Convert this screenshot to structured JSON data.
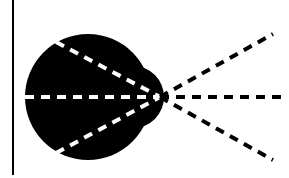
{
  "diagram": {
    "type": "ray-convergence-divergence",
    "background": "#ffffff",
    "ink": "#000000",
    "dash_light": "#ffffff",
    "axis_line": {
      "x": 13,
      "y1": 0,
      "y2": 175
    },
    "blob": {
      "main_circle": {
        "cx": 88,
        "cy": 97,
        "r": 63
      },
      "bump_circle": {
        "cx": 133,
        "cy": 97,
        "r": 31
      }
    },
    "focal_point": {
      "x": 160,
      "y": 97
    },
    "converging_rays": [
      {
        "x1": 56,
        "y1": 42,
        "x2": 160,
        "y2": 97
      },
      {
        "x1": 25,
        "y1": 97,
        "x2": 160,
        "y2": 97
      },
      {
        "x1": 56,
        "y1": 153,
        "x2": 160,
        "y2": 97
      }
    ],
    "diverging_rays": [
      {
        "x1": 160,
        "y1": 97,
        "x2": 273,
        "y2": 34
      },
      {
        "x1": 160,
        "y1": 97,
        "x2": 284,
        "y2": 97
      },
      {
        "x1": 160,
        "y1": 97,
        "x2": 273,
        "y2": 160
      }
    ]
  }
}
